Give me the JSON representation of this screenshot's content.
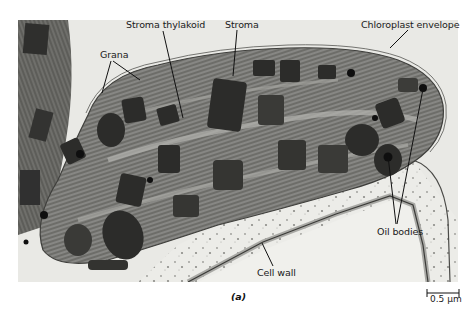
{
  "figure": {
    "panel_label": "(a)",
    "labels": {
      "grana": "Grana",
      "stroma_thylakoid": "Stroma thylakoid",
      "stroma": "Stroma",
      "chloroplast_envelope": "Chloroplast envelope",
      "oil_bodies": "Oil bodies",
      "cell_wall": "Cell wall"
    },
    "scale_bar": {
      "label": "0.5 μm"
    },
    "colors": {
      "background": "#ffffff",
      "cytoplasm_light": "#e6e6e2",
      "stroma_gray": "#8a8a86",
      "grana_dark": "#2a2a28",
      "leader_line": "#111111"
    }
  }
}
